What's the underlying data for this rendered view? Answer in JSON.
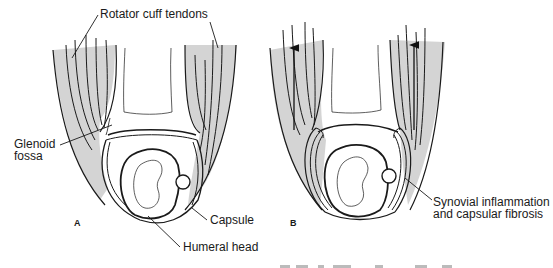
{
  "figure": {
    "panels": [
      {
        "id": "A",
        "letter": "A",
        "labels": {
          "rotator_cuff": "Rotator cuff tendons",
          "glenoid_line1": "Glenoid",
          "glenoid_line2": "fossa",
          "capsule": "Capsule",
          "humeral_head": "Humeral head"
        }
      },
      {
        "id": "B",
        "letter": "B",
        "labels": {
          "synovial_line1": "Synovial  inflammation",
          "synovial_line2": "and capsular fibrosis"
        }
      }
    ],
    "colors": {
      "line": "#1a1a1a",
      "tendon_fill": "#d4d4d4",
      "background": "#ffffff"
    }
  }
}
